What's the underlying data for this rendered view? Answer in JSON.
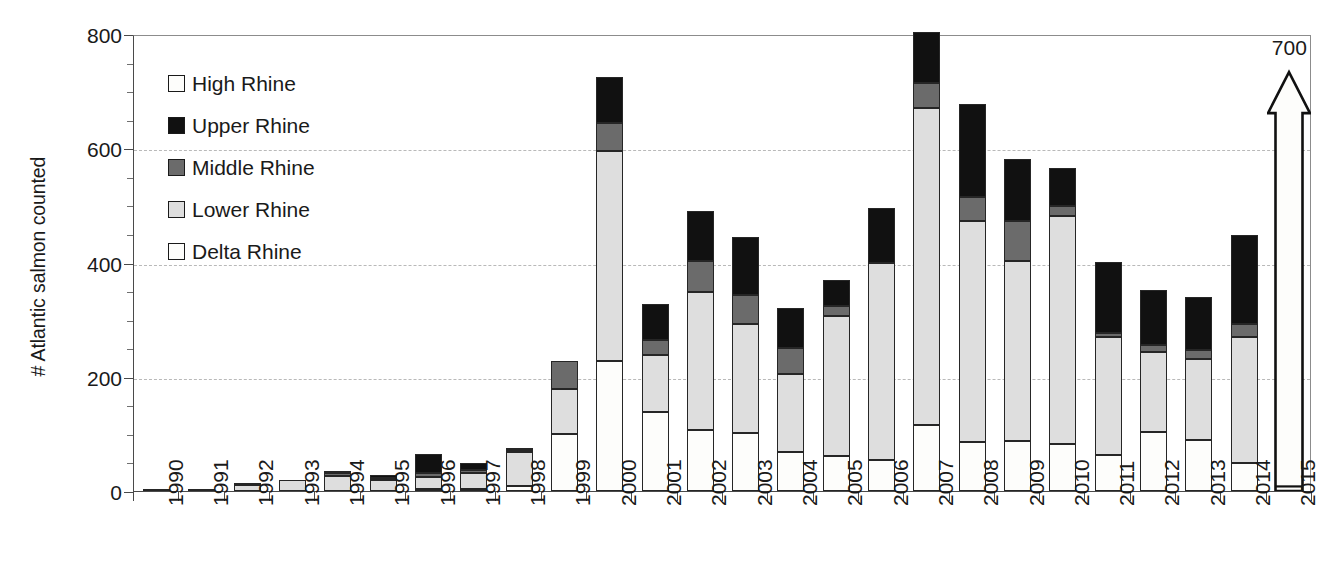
{
  "chart_data": {
    "type": "bar",
    "stacked": true,
    "title": "",
    "xlabel": "",
    "ylabel": "# Atlantic salmon counted",
    "ylim": [
      0,
      800
    ],
    "y_major_ticks": [
      0,
      200,
      400,
      600,
      800
    ],
    "y_minor_tick_step": 50,
    "grid": "horizontal-dashed",
    "legend_position": "upper-left-inside",
    "categories": [
      "1990",
      "1991",
      "1992",
      "1993",
      "1994",
      "1995",
      "1996",
      "1997",
      "1998",
      "1999",
      "2000",
      "2001",
      "2002",
      "2003",
      "2004",
      "2005",
      "2006",
      "2007",
      "2008",
      "2009",
      "2010",
      "2011",
      "2012",
      "2013",
      "2014",
      "2015"
    ],
    "series": [
      {
        "name": "Delta Rhine",
        "color": "#fdfdfb",
        "values": [
          0,
          0,
          0,
          0,
          0,
          0,
          4,
          4,
          8,
          100,
          228,
          138,
          106,
          101,
          69,
          61,
          55,
          115,
          86,
          88,
          83,
          63,
          103,
          90,
          49,
          8
        ]
      },
      {
        "name": "Lower Rhine",
        "color": "#dedede",
        "values": [
          2,
          3,
          11,
          20,
          26,
          19,
          21,
          28,
          61,
          78,
          367,
          100,
          243,
          192,
          136,
          245,
          344,
          556,
          386,
          315,
          398,
          206,
          141,
          141,
          221,
          0
        ]
      },
      {
        "name": "Middle Rhine",
        "color": "#6b6b6b",
        "values": [
          0,
          0,
          1,
          0,
          5,
          3,
          6,
          5,
          2,
          50,
          50,
          27,
          53,
          50,
          45,
          18,
          0,
          43,
          43,
          69,
          18,
          7,
          11,
          16,
          22,
          0
        ]
      },
      {
        "name": "Upper Rhine",
        "color": "#111111",
        "values": [
          0,
          0,
          0,
          0,
          2,
          6,
          33,
          12,
          1,
          0,
          80,
          62,
          89,
          102,
          70,
          45,
          96,
          90,
          162,
          109,
          66,
          125,
          97,
          93,
          156,
          0
        ]
      },
      {
        "name": "High Rhine",
        "color": "#fdfdfb",
        "values": [
          0,
          0,
          0,
          0,
          0,
          0,
          0,
          0,
          0,
          0,
          0,
          0,
          0,
          0,
          0,
          0,
          0,
          0,
          0,
          0,
          0,
          0,
          0,
          0,
          0,
          0
        ]
      }
    ],
    "totals": [
      2,
      3,
      12,
      20,
      33,
      28,
      64,
      49,
      72,
      228,
      725,
      327,
      491,
      445,
      320,
      369,
      495,
      804,
      677,
      581,
      565,
      401,
      352,
      340,
      448,
      700
    ],
    "annotations": [
      {
        "category": "2015",
        "type": "up-arrow",
        "label": "700",
        "note": "bar truncated; arrow indicates value exceeds axis maximum"
      }
    ]
  },
  "legend": {
    "items": [
      {
        "label": "High Rhine",
        "swatch": "#fdfdfb"
      },
      {
        "label": "Upper Rhine",
        "swatch": "#111111"
      },
      {
        "label": "Middle Rhine",
        "swatch": "#6b6b6b"
      },
      {
        "label": "Lower Rhine",
        "swatch": "#dedede"
      },
      {
        "label": "Delta Rhine",
        "swatch": "#fdfdfb"
      }
    ]
  },
  "axes": {
    "y_title": "# Atlantic salmon counted",
    "y_tick_labels": [
      "0",
      "200",
      "400",
      "600",
      "800"
    ]
  }
}
